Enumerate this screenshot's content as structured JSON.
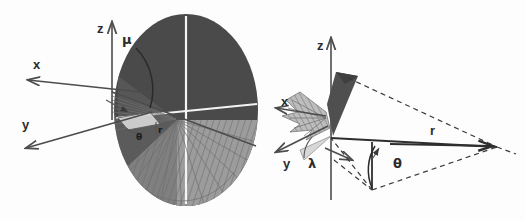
{
  "figure": {
    "background_color": "#fdfdfd",
    "width": 525,
    "height": 220,
    "panels": [
      {
        "id": "left-panel",
        "name": "disk-coordinate-diagram",
        "description": "Three-dimensional axis frame with a large shaded elliptical disk, polar angle arc and radial fan",
        "axes": [
          {
            "label": "z",
            "direction": "up"
          },
          {
            "label": "x",
            "direction": "upper-left"
          },
          {
            "label": "y",
            "direction": "lower-left"
          }
        ],
        "angle_labels": [
          {
            "label": "μ",
            "name": "mu-angle-label"
          },
          {
            "label": "θ",
            "name": "theta-angle-label"
          }
        ],
        "length_labels": [
          {
            "label": "r",
            "name": "radius-label"
          }
        ],
        "shading": {
          "dark_region": "#4a4a4a",
          "light_region": "#9c9c9c",
          "highlight": "#f2f2f2"
        }
      },
      {
        "id": "right-panel",
        "name": "cone-coordinate-diagram",
        "description": "Three-dimensional axis frame with a dark vertical cone, a horizontal plane and dashed projection lines meeting at a far right vertex",
        "axes": [
          {
            "label": "z",
            "direction": "up"
          },
          {
            "label": "x",
            "direction": "upper-left"
          },
          {
            "label": "y",
            "direction": "lower-left"
          }
        ],
        "angle_labels": [
          {
            "label": "λ",
            "name": "lambda-angle-label"
          },
          {
            "label": "θ",
            "name": "theta-angle-label"
          }
        ],
        "length_labels": [
          {
            "label": "r",
            "name": "radius-label"
          }
        ],
        "shading": {
          "cone_fill": "#4f4f4f",
          "wedge_fill": "#d0d0d0",
          "fan_fill": "#8e8e8e"
        }
      }
    ]
  },
  "labels": {
    "left": {
      "z": "z",
      "x": "x",
      "y": "y",
      "mu": "μ",
      "theta": "θ",
      "r": "r"
    },
    "right": {
      "z": "z",
      "x": "x",
      "y": "y",
      "lambda": "λ",
      "theta": "θ",
      "r": "r"
    }
  },
  "colors": {
    "background": "#fdfdfd",
    "ink": "#2c2c2c",
    "dark_gray": "#4a4a4a",
    "mid_gray": "#7d7d7d",
    "light_gray": "#9c9c9c",
    "pale_gray": "#d0d0d0",
    "white_highlight": "#f4f4f4"
  }
}
